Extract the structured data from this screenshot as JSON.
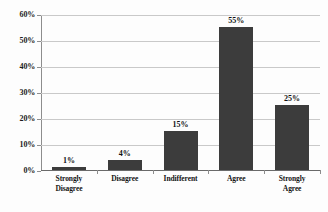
{
  "chart_data": {
    "type": "bar",
    "title": "",
    "subtitle": "",
    "xlabel": "",
    "ylabel": "",
    "categories": [
      "Strongly Disagree",
      "Disagree",
      "Indifferent",
      "Agree",
      "Strongly Agree"
    ],
    "category_lines": [
      [
        "Strongly",
        "Disagree"
      ],
      [
        "Disagree"
      ],
      [
        "Indifferent"
      ],
      [
        "Agree"
      ],
      [
        "Strongly Agree"
      ]
    ],
    "values": [
      1,
      4,
      15,
      55,
      25
    ],
    "value_labels": [
      "1%",
      "4%",
      "15%",
      "55%",
      "25%"
    ],
    "ylim": [
      0,
      60
    ],
    "ytick_values": [
      0,
      10,
      20,
      30,
      40,
      50,
      60
    ],
    "ytick_labels": [
      "0%",
      "10%",
      "20%",
      "30%",
      "40%",
      "50%",
      "60%"
    ],
    "grid": true,
    "grid_axis": "y",
    "legend": false,
    "legend_position": "none",
    "colors": {
      "bar": "#3c3c3c",
      "gridline": "#c9c9c9",
      "axis": "#8d8d8d",
      "text": "#141414",
      "background": "#fdfdfd"
    }
  }
}
